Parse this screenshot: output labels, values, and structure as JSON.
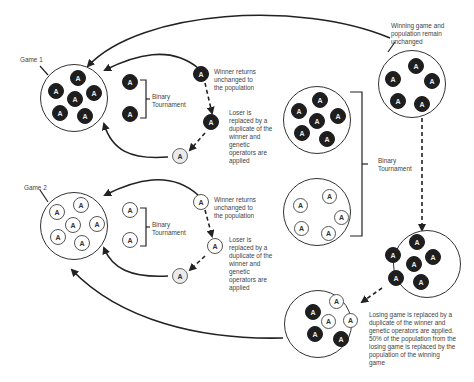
{
  "labels": {
    "game1": "Game 1",
    "game2": "Game 2",
    "binary_tournament_g1": "Binary\nTournament",
    "binary_tournament_g2": "Binary\nTournament",
    "binary_tournament_games": "Binary\nTournament",
    "winner_returns_g1": "Winner returns\nunchanged to\nthe population",
    "loser_replaced_g1": "Loser is\nreplaced by a\nduplicate of the\nwinner and\ngenetic\noperators are\napplied",
    "winner_returns_g2": "Winner returns\nunchanged to\nthe population",
    "loser_replaced_g2": "Loser is\nreplaced by a\nduplicate of the\nwinner and\ngenetic\noperators are\napplied",
    "winning_game_unchanged": "Winning game and\npopulation remain\nunchanged",
    "losing_game_replaced": "Losing game is replaced by a\nduplicate of the winner and\ngenetic operators are applied.\n50% of the population from the\nlosing game is replaced by the\npopulation of the winning\ngame"
  },
  "token_glyph": "A",
  "colors": {
    "dark_token": "#1e1e1e",
    "light_token": "#ffffff",
    "grey_token": "#eaeaea",
    "line": "#333333"
  }
}
